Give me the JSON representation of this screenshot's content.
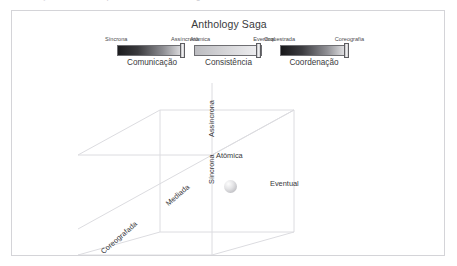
{
  "figure": {
    "title": "Anthology Saga",
    "bleed_fragments": [
      "ção",
      "que",
      "gem"
    ]
  },
  "sliders": [
    {
      "id": "comunicacao",
      "caption": "Comunicação",
      "left_label": "Síncrona",
      "right_label": "Assíncrona",
      "handle_percent": 93,
      "gradient_from": "#1c1c1e",
      "gradient_to": "#e8e8ea"
    },
    {
      "id": "consistencia",
      "caption": "Consistência",
      "left_label": "Atômica",
      "right_label": "Eventual",
      "handle_percent": 90,
      "gradient_from": "#bcbcc0",
      "gradient_to": "#f0f0f2"
    },
    {
      "id": "coordenacao",
      "caption": "Coordenação",
      "left_label": "Orquestrada",
      "right_label": "Coreografia",
      "handle_percent": 93,
      "gradient_from": "#17171a",
      "gradient_to": "#ececee"
    }
  ],
  "cube": {
    "axis_labels": {
      "asincrona": "Assíncrona",
      "sincrona": "Síncrona",
      "atomica": "Atômica",
      "eventual": "Eventual",
      "mediada": "Mediada",
      "coreografada": "Coreografada"
    },
    "marker": "state-sphere",
    "edge_color": "#dcdce0"
  }
}
